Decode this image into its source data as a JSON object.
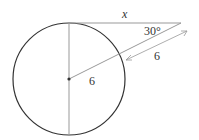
{
  "diagram": {
    "type": "geometry",
    "labels": {
      "tangent": "x",
      "angle": "30°",
      "external_segment": "6",
      "radius": "6"
    },
    "colors": {
      "circle": "#333333",
      "lines": "#888888",
      "text": "#333333"
    }
  }
}
